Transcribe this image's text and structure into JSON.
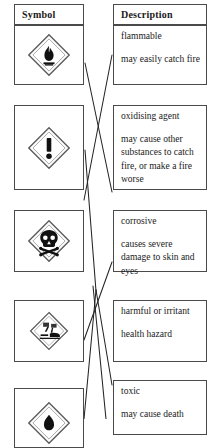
{
  "document": {
    "kind": "hazard-symbol-matching-exercise",
    "columns": [
      {
        "id": "symbol",
        "header": "Symbol"
      },
      {
        "id": "description",
        "header": "Description"
      }
    ]
  },
  "symbols": [
    {
      "id": "flammable",
      "icon_name": "flame-diamond-icon",
      "alt": "flame in diamond"
    },
    {
      "id": "exclamation",
      "icon_name": "exclamation-mark-diamond-icon",
      "alt": "exclamation mark in diamond"
    },
    {
      "id": "toxic",
      "icon_name": "skull-crossbones-diamond-icon",
      "alt": "skull and crossbones in diamond"
    },
    {
      "id": "corrosive",
      "icon_name": "corrosion-diamond-icon",
      "alt": "liquid corroding surface in diamond"
    },
    {
      "id": "partial",
      "icon_name": "diamond-partial-icon",
      "alt": "partially visible diamond symbol"
    }
  ],
  "descriptions": [
    {
      "id": "flammable",
      "lines": [
        "flammable",
        "may easily catch fire"
      ]
    },
    {
      "id": "oxidising",
      "lines": [
        "oxidising agent",
        "may cause other substances to catch fire, or make a fire worse"
      ]
    },
    {
      "id": "corrosive",
      "lines": [
        "corrosive",
        "causes severe damage to skin and eyes"
      ]
    },
    {
      "id": "harmful",
      "lines": [
        "harmful or irritant",
        "health hazard"
      ]
    },
    {
      "id": "toxic",
      "lines": [
        "toxic",
        "may cause death"
      ]
    }
  ],
  "colors": {
    "border": "#4a4a4a",
    "text": "#1a1a1a",
    "line": "#242424",
    "background": "#ffffff"
  },
  "connectors": {
    "count": 6,
    "note": "hand-drawn matching lines crossing between the Symbol and Description columns"
  }
}
